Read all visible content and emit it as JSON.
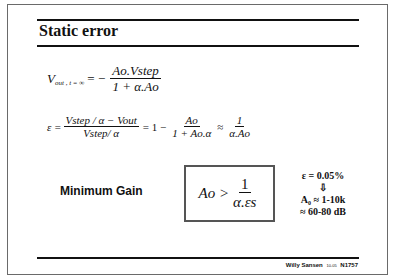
{
  "slide": {
    "title": "Static error",
    "equation1": {
      "lhs_main": "V",
      "lhs_sub": "out , t = ∞",
      "equals": "= −",
      "numerator": "Ao.Vstep",
      "denominator": "1 + α.Ao"
    },
    "equation2": {
      "lhs": "ε =",
      "frac1_num": "Vstep / α − Vout",
      "frac1_den": "Vstep/ α",
      "mid": "= 1 −",
      "frac2_num": "Ao",
      "frac2_den": "1 + Ao.α",
      "approx": "≈",
      "frac3_num": "1",
      "frac3_den": "α.Ao"
    },
    "min_gain_label": "Minimum Gain",
    "boxed_formula": {
      "lhs": "Ao >",
      "numerator": "1",
      "denominator": "α.εs"
    },
    "side_notes": {
      "line1": "ε = 0.05%",
      "arrow": "⇩",
      "line3": "A₀ ≈ 1-10k",
      "line4": "≈ 60-80 dB"
    },
    "footer": {
      "author": "Willy Sansen",
      "date": "10-05",
      "code": "N1757"
    }
  }
}
